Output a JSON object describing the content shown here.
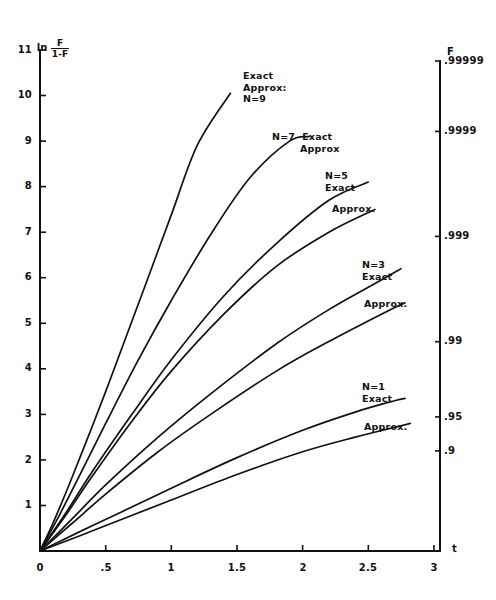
{
  "chart_data": {
    "type": "line",
    "title": "",
    "xlabel": "t",
    "ylabel_text": "ln",
    "ylabel_numerator": "F",
    "ylabel_denominator": "1-F",
    "right_axis_label": "F",
    "xlim": [
      0,
      3.4
    ],
    "ylim": [
      0,
      11
    ],
    "grid": false,
    "legend_position": "inline-annotations",
    "xticks": [
      0,
      0.5,
      1,
      1.5,
      2,
      2.5,
      3
    ],
    "xticklabels": [
      "0",
      ".5",
      "1",
      "1.5",
      "2",
      "2.5",
      "3"
    ],
    "yticks": [
      1,
      2,
      3,
      4,
      5,
      6,
      7,
      8,
      9,
      10,
      11
    ],
    "yticklabels": [
      "1",
      "2",
      "3",
      "4",
      "5",
      "6",
      "7",
      "8",
      "9",
      "10",
      "11"
    ],
    "right_ticks_y": [
      2.197,
      2.944,
      4.595,
      6.907,
      9.21,
      11.513
    ],
    "right_ticklabels": [
      ".9",
      ".95",
      ".99",
      ".999",
      ".9999",
      ".99999"
    ],
    "series": [
      {
        "name": "N=9 Exact/Approx",
        "label": "Exact\nApprox:\nN=9",
        "x": [
          0,
          0.1,
          0.2,
          0.3,
          0.4,
          0.5,
          0.6,
          0.8,
          1.0,
          1.2,
          1.45
        ],
        "y": [
          0,
          0.62,
          1.3,
          2.02,
          2.75,
          3.5,
          4.27,
          5.82,
          7.38,
          8.92,
          10.05
        ]
      },
      {
        "name": "N=7 Exact/Approx",
        "label": "N=7 Exact\nApprox",
        "x": [
          0,
          0.15,
          0.3,
          0.5,
          0.75,
          1.0,
          1.3,
          1.6,
          1.9,
          2.05
        ],
        "y": [
          0,
          0.8,
          1.65,
          2.8,
          4.2,
          5.5,
          6.95,
          8.2,
          9.0,
          9.1
        ]
      },
      {
        "name": "N=5 Exact",
        "label": "N=5\nExact",
        "x": [
          0,
          0.2,
          0.4,
          0.7,
          1.0,
          1.4,
          1.8,
          2.2,
          2.5
        ],
        "y": [
          0,
          0.85,
          1.75,
          3.0,
          4.2,
          5.6,
          6.75,
          7.7,
          8.1
        ]
      },
      {
        "name": "N=5 Approx.",
        "label": "Approx.",
        "x": [
          0,
          0.2,
          0.4,
          0.7,
          1.0,
          1.4,
          1.8,
          2.2,
          2.55
        ],
        "y": [
          0,
          0.8,
          1.65,
          2.85,
          3.95,
          5.2,
          6.25,
          7.0,
          7.5
        ]
      },
      {
        "name": "N=3 Exact",
        "label": "N=3\nExact",
        "x": [
          0,
          0.25,
          0.5,
          0.9,
          1.3,
          1.8,
          2.2,
          2.6,
          2.75
        ],
        "y": [
          0,
          0.72,
          1.45,
          2.5,
          3.45,
          4.55,
          5.3,
          5.95,
          6.2
        ]
      },
      {
        "name": "N=3 Approx.",
        "label": "Approx.",
        "x": [
          0,
          0.25,
          0.5,
          0.9,
          1.3,
          1.8,
          2.2,
          2.6,
          2.78
        ],
        "y": [
          0,
          0.62,
          1.25,
          2.18,
          3.0,
          3.95,
          4.6,
          5.2,
          5.45
        ]
      },
      {
        "name": "N=1 Exact",
        "label": "N=1\nExact",
        "x": [
          0,
          0.3,
          0.6,
          1.0,
          1.5,
          2.0,
          2.4,
          2.7,
          2.78
        ],
        "y": [
          0,
          0.42,
          0.83,
          1.38,
          2.05,
          2.65,
          3.05,
          3.3,
          3.35
        ]
      },
      {
        "name": "N=1 Approx.",
        "label": "Approx.",
        "x": [
          0,
          0.3,
          0.6,
          1.0,
          1.5,
          2.0,
          2.4,
          2.75,
          2.82
        ],
        "y": [
          0,
          0.33,
          0.67,
          1.12,
          1.68,
          2.18,
          2.5,
          2.75,
          2.8
        ]
      }
    ],
    "annotations": [
      {
        "id": "ann-n9",
        "text": "Exact\nApprox:\nN=9",
        "x_px": 243,
        "y_px": 70
      },
      {
        "id": "ann-n7",
        "text": "N=7  Exact\n        Approx",
        "x_px": 272,
        "y_px": 131
      },
      {
        "id": "ann-n5-exact",
        "text": "N=5\nExact",
        "x_px": 325,
        "y_px": 170
      },
      {
        "id": "ann-n5-approx",
        "text": "Approx.",
        "x_px": 332,
        "y_px": 203
      },
      {
        "id": "ann-n3-exact",
        "text": "N=3\nExact",
        "x_px": 362,
        "y_px": 259
      },
      {
        "id": "ann-n3-approx",
        "text": "Approx.",
        "x_px": 364,
        "y_px": 298
      },
      {
        "id": "ann-n1-exact",
        "text": "N=1\nExact",
        "x_px": 362,
        "y_px": 381
      },
      {
        "id": "ann-n1-approx",
        "text": "Approx.",
        "x_px": 364,
        "y_px": 421
      }
    ]
  },
  "axes": {
    "y_title_prefix": "ln",
    "y_title_num": "F",
    "y_title_den": "1-F",
    "x_title": "t",
    "right_title": "F"
  }
}
